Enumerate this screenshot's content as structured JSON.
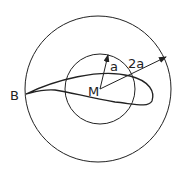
{
  "diagram": {
    "labels": {
      "point_b": "B",
      "point_m": "M",
      "radius_small": "a",
      "radius_large": "2a"
    },
    "colors": {
      "stroke": "#222222",
      "background": "#ffffff"
    }
  }
}
